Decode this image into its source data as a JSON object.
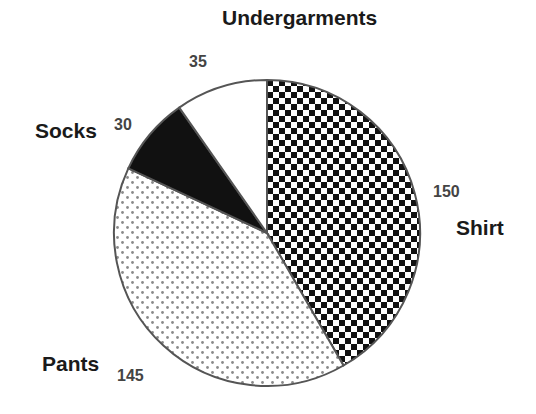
{
  "chart_data": {
    "type": "pie",
    "title": "",
    "start_angle_deg": 0,
    "direction": "clockwise",
    "legend": "none (labels placed next to slices)",
    "categories": [
      "Shirt",
      "Pants",
      "Socks",
      "Undergarments"
    ],
    "values": [
      150,
      145,
      30,
      35
    ],
    "slices": [
      {
        "label": "Shirt",
        "value": 150,
        "pattern": "checkerboard",
        "value_text": "150"
      },
      {
        "label": "Pants",
        "value": 145,
        "pattern": "dots",
        "value_text": "145"
      },
      {
        "label": "Socks",
        "value": 30,
        "pattern": "solid-black",
        "value_text": "30"
      },
      {
        "label": "Undergarments",
        "value": 35,
        "pattern": "white",
        "value_text": "35"
      }
    ],
    "labels": [
      {
        "name": "Shirt",
        "x": 456,
        "y": 235,
        "anchor": "start",
        "value_x": 433,
        "value_y": 197
      },
      {
        "name": "Pants",
        "x": 42,
        "y": 371,
        "anchor": "start",
        "value_x": 117,
        "value_y": 381
      },
      {
        "name": "Socks",
        "x": 35,
        "y": 138,
        "anchor": "start",
        "value_x": 114,
        "value_y": 130
      },
      {
        "name": "Undergarments",
        "x": 222,
        "y": 25,
        "anchor": "start",
        "value_x": 189,
        "value_y": 67
      }
    ],
    "geometry": {
      "cx": 267,
      "cy": 233,
      "r": 153
    }
  },
  "colors": {
    "outline": "#555555",
    "black": "#111111",
    "white": "#ffffff",
    "dot": "#8a8a8a",
    "label": "#1a1a1a",
    "value": "#444444"
  }
}
